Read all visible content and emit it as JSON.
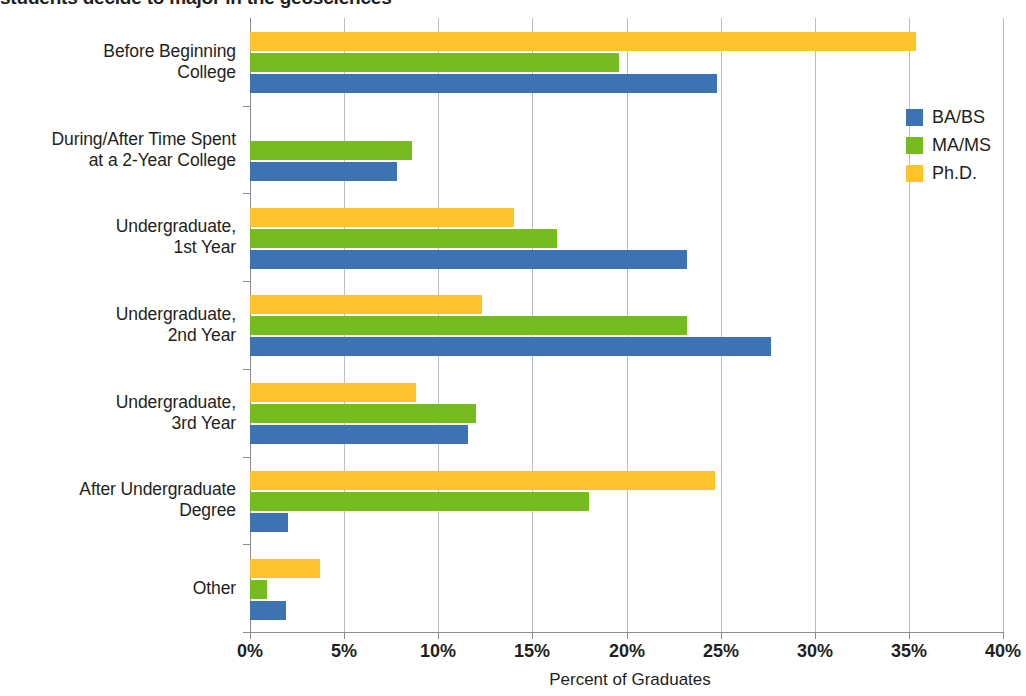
{
  "title": "students decide to major in the geosciences",
  "chart_data": {
    "type": "bar",
    "orientation": "horizontal",
    "title": "students decide to major in the geosciences",
    "xlabel": "Percent of Graduates",
    "ylabel": "",
    "xlim": [
      0,
      40
    ],
    "xticks": [
      "0%",
      "5%",
      "10%",
      "15%",
      "20%",
      "25%",
      "30%",
      "35%",
      "40%"
    ],
    "xtick_values": [
      0,
      5,
      10,
      15,
      20,
      25,
      30,
      35,
      40
    ],
    "grid": "vertical",
    "legend_position": "right",
    "categories": [
      "Before Beginning College",
      "During/After Time Spent at a 2-Year College",
      "Undergraduate, 1st Year",
      "Undergraduate, 2nd Year",
      "Undergraduate, 3rd Year",
      "After Undergraduate Degree",
      "Other"
    ],
    "category_lines": [
      [
        "Before Beginning",
        "College"
      ],
      [
        "During/After Time Spent",
        "at a 2-Year College"
      ],
      [
        "Undergraduate,",
        "1st Year"
      ],
      [
        "Undergraduate,",
        "2nd Year"
      ],
      [
        "Undergraduate,",
        "3rd Year"
      ],
      [
        "After Undergraduate",
        "Degree"
      ],
      [
        "Other"
      ]
    ],
    "series": [
      {
        "name": "BA/BS",
        "color": "#3d72b4",
        "values": [
          24.8,
          7.8,
          23.2,
          27.7,
          11.6,
          2.0,
          1.9
        ]
      },
      {
        "name": "MA/MS",
        "color": "#76bc21",
        "values": [
          19.6,
          8.6,
          16.3,
          23.2,
          12.0,
          18.0,
          0.9
        ]
      },
      {
        "name": "Ph.D.",
        "color": "#fdc22e",
        "values": [
          35.4,
          0.0,
          14.0,
          12.3,
          8.8,
          24.7,
          3.7
        ]
      }
    ]
  },
  "legend": {
    "items": [
      {
        "label": "BA/BS"
      },
      {
        "label": "MA/MS"
      },
      {
        "label": "Ph.D."
      }
    ]
  }
}
